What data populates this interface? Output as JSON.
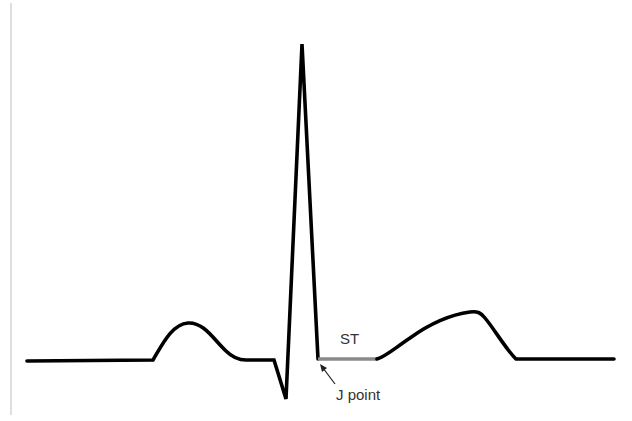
{
  "diagram": {
    "type": "ECG waveform (single cardiac cycle)",
    "labels": {
      "st": "ST",
      "j_point": "J point"
    },
    "colors": {
      "trace": "#000000",
      "st_segment": "#8a8a8a",
      "left_rule": "#c8c8c8",
      "label_text": "#333333",
      "background": "#ffffff"
    },
    "waveform": {
      "baseline_y": 360,
      "components": [
        "P wave",
        "PR segment",
        "Q wave",
        "R wave",
        "J point",
        "ST segment",
        "T wave"
      ]
    }
  }
}
